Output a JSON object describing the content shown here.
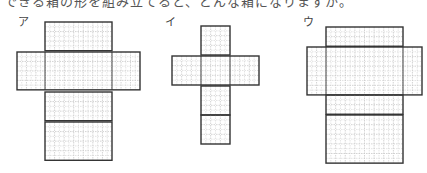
{
  "caption": "できる箱の形を組み立てると、どんな箱になりますか。",
  "cell_size_px": 10,
  "colors": {
    "outline": "#333333",
    "grid": "#c8c8c8",
    "label": "#444444"
  },
  "figures": [
    {
      "label": "ア",
      "label_pos": [
        18,
        14
      ],
      "parts": [
        {
          "x": 45,
          "y": 22,
          "cols": 7,
          "rows": 3
        },
        {
          "x": 17,
          "y": 52,
          "cols": 13,
          "rows": 4,
          "dividers_x": [
            45,
            112
          ]
        },
        {
          "x": 45,
          "y": 92,
          "cols": 7,
          "rows": 3
        },
        {
          "x": 45,
          "y": 122,
          "cols": 7,
          "rows": 4
        }
      ],
      "size": {
        "w": 67,
        "w_mid": 123
      }
    },
    {
      "label": "イ",
      "label_pos": [
        165,
        14
      ],
      "parts": [
        {
          "x": 201,
          "y": 26,
          "cols": 3,
          "rows": 3
        },
        {
          "x": 172,
          "y": 56,
          "cols": 9,
          "rows": 3,
          "dividers_x": [
            201,
            230
          ]
        },
        {
          "x": 201,
          "y": 86,
          "cols": 3,
          "rows": 3
        },
        {
          "x": 201,
          "y": 115,
          "cols": 3,
          "rows": 3
        }
      ]
    },
    {
      "label": "ウ",
      "label_pos": [
        303,
        14
      ],
      "parts": [
        {
          "x": 326,
          "y": 27,
          "cols": 8,
          "rows": 2
        },
        {
          "x": 307,
          "y": 47,
          "cols": 12,
          "rows": 5,
          "dividers_x": [
            326,
            403
          ]
        },
        {
          "x": 326,
          "y": 95,
          "cols": 8,
          "rows": 2
        },
        {
          "x": 326,
          "y": 115,
          "cols": 8,
          "rows": 5
        }
      ]
    }
  ]
}
